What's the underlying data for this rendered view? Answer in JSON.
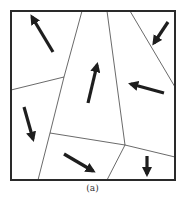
{
  "figure": {
    "caption": "(a)",
    "colors": {
      "frame": "#2a2a2a",
      "boundary": "#444444",
      "arrow": "#1e1e1e",
      "background": "#ffffff"
    },
    "frame": {
      "x1": 11,
      "y1": 11,
      "x2": 175,
      "y2": 180
    },
    "boundaries": [
      {
        "points": [
          [
            82,
            11
          ],
          [
            64,
            77
          ],
          [
            50,
            133
          ],
          [
            38,
            180
          ]
        ]
      },
      {
        "points": [
          [
            107,
            11
          ],
          [
            125,
            145
          ],
          [
            107,
            180
          ]
        ]
      },
      {
        "points": [
          [
            125,
            145
          ],
          [
            175,
            157
          ]
        ]
      },
      {
        "points": [
          [
            50,
            133
          ],
          [
            125,
            145
          ]
        ]
      },
      {
        "points": [
          [
            11,
            90
          ],
          [
            64,
            77
          ]
        ]
      },
      {
        "points": [
          [
            130,
            11
          ],
          [
            175,
            87
          ]
        ]
      }
    ],
    "arrows": [
      {
        "from": [
          53,
          52
        ],
        "to": [
          32,
          17
        ]
      },
      {
        "from": [
          168,
          22
        ],
        "to": [
          154,
          43
        ]
      },
      {
        "from": [
          88,
          103
        ],
        "to": [
          97,
          65
        ]
      },
      {
        "from": [
          164,
          93
        ],
        "to": [
          131,
          84
        ]
      },
      {
        "from": [
          24,
          107
        ],
        "to": [
          33,
          139
        ]
      },
      {
        "from": [
          64,
          154
        ],
        "to": [
          93,
          171
        ]
      },
      {
        "from": [
          147,
          156
        ],
        "to": [
          147,
          174
        ]
      }
    ]
  }
}
